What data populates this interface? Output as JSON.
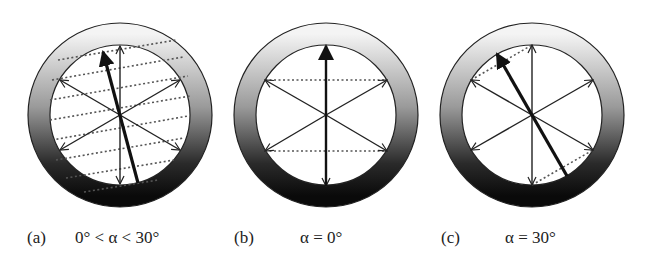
{
  "figure": {
    "panels": [
      {
        "id": "a",
        "letter": "(a)",
        "condition": "0° < α < 30°",
        "center": [
          120,
          115
        ],
        "highlight_angle_deg": 10,
        "dotted_lines": "many parallel dotted lines tilted by alpha"
      },
      {
        "id": "b",
        "letter": "(b)",
        "condition": "α = 0°",
        "center": [
          326,
          115
        ],
        "highlight_angle_deg": 0,
        "dotted_lines": "two horizontal dotted lines connecting arrow tips"
      },
      {
        "id": "c",
        "letter": "(c)",
        "condition": "α = 30°",
        "center": [
          532,
          115
        ],
        "highlight_angle_deg": 30,
        "dotted_lines": "two dotted lines tilted by 30°"
      }
    ],
    "ring": {
      "outer_radius": 92,
      "inner_radius": 70,
      "gradient_top": "#f2f2f2",
      "gradient_bottom": "#111111"
    },
    "arrow_axes_deg": [
      90,
      30,
      150
    ]
  }
}
